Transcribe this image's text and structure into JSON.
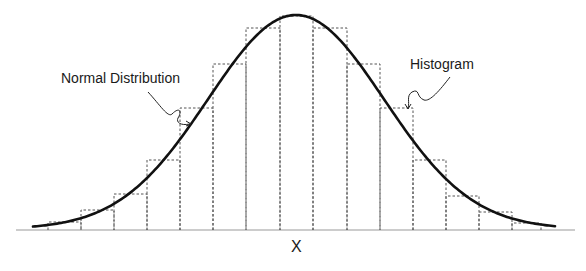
{
  "chart_data": {
    "type": "bar",
    "title": "",
    "xlabel": "X",
    "ylabel": "",
    "grid": false,
    "annotations": [
      {
        "text": "Normal Distribution",
        "points_to": "curve"
      },
      {
        "text": "Histogram",
        "points_to": "histogram bar"
      }
    ],
    "bar_style": "dashed outline, no fill",
    "bin_edges_px": [
      48,
      81,
      114,
      147,
      180,
      213,
      246,
      280,
      313,
      347,
      380,
      413,
      446,
      479,
      512,
      541
    ],
    "values": [
      8,
      20,
      36,
      70,
      122,
      166,
      202,
      214,
      202,
      166,
      122,
      70,
      34,
      18,
      7
    ],
    "overlay": {
      "type": "line",
      "name": "Normal Distribution",
      "shape": "bell curve",
      "peak_x_px": 296,
      "peak_height": 214
    }
  },
  "labels": {
    "normal": "Normal Distribution",
    "histogram": "Histogram",
    "x_axis": "X"
  },
  "colors": {
    "curve": "#111111",
    "bars": "#555555",
    "axis": "#888888"
  }
}
